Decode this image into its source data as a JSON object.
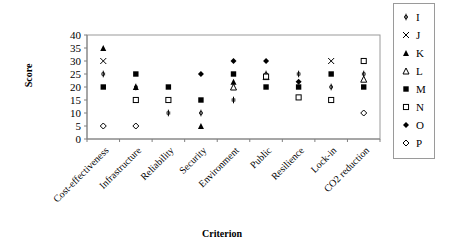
{
  "chart_data": {
    "type": "scatter",
    "title": "",
    "xlabel": "Criterion",
    "ylabel": "Score",
    "ylim": [
      0,
      40
    ],
    "yticks": [
      0,
      5,
      10,
      15,
      20,
      25,
      30,
      35,
      40
    ],
    "grid": false,
    "legend_position": "right",
    "categories": [
      "Cost-effectiveness",
      "Infrastructure",
      "Reliability",
      "Security",
      "Environment",
      "Public",
      "Resilience",
      "Lock-in",
      "CO2 reduction"
    ],
    "series": [
      {
        "name": "I",
        "marker": "asterisk",
        "values": [
          25,
          20,
          10,
          10,
          15,
          25,
          25,
          20,
          25
        ]
      },
      {
        "name": "J",
        "marker": "x",
        "values": [
          30,
          null,
          null,
          null,
          null,
          null,
          null,
          30,
          null
        ]
      },
      {
        "name": "K",
        "marker": "triangle-filled",
        "values": [
          35,
          20,
          null,
          5,
          22,
          null,
          null,
          null,
          null
        ]
      },
      {
        "name": "L",
        "marker": "triangle-open",
        "values": [
          null,
          null,
          null,
          null,
          20,
          24,
          null,
          null,
          23
        ]
      },
      {
        "name": "M",
        "marker": "square-filled",
        "values": [
          20,
          25,
          20,
          15,
          25,
          20,
          20,
          25,
          20
        ]
      },
      {
        "name": "N",
        "marker": "square-open",
        "values": [
          null,
          15,
          15,
          null,
          null,
          24,
          16,
          15,
          30
        ]
      },
      {
        "name": "O",
        "marker": "diamond-filled",
        "values": [
          null,
          null,
          null,
          25,
          30,
          30,
          22,
          null,
          null
        ]
      },
      {
        "name": "P",
        "marker": "diamond-open",
        "values": [
          5,
          5,
          null,
          null,
          null,
          null,
          null,
          null,
          10
        ]
      }
    ]
  },
  "axis": {
    "x_title": "Criterion",
    "y_title": "Score"
  },
  "legend": {
    "items": [
      {
        "label": "I",
        "marker": "asterisk"
      },
      {
        "label": "J",
        "marker": "x"
      },
      {
        "label": "K",
        "marker": "triangle-filled"
      },
      {
        "label": "L",
        "marker": "triangle-open"
      },
      {
        "label": "M",
        "marker": "square-filled"
      },
      {
        "label": "N",
        "marker": "square-open"
      },
      {
        "label": "O",
        "marker": "diamond-filled"
      },
      {
        "label": "P",
        "marker": "diamond-open"
      }
    ]
  }
}
